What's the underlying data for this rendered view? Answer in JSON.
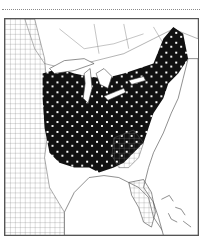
{
  "figure": {
    "type": "choropleth-map",
    "region": "Eastern United States (county level)",
    "legend": [],
    "colors": {
      "filled": "#111111",
      "unfilled": "#ffffff",
      "boundary": "#555555",
      "frame": "#555555"
    }
  }
}
